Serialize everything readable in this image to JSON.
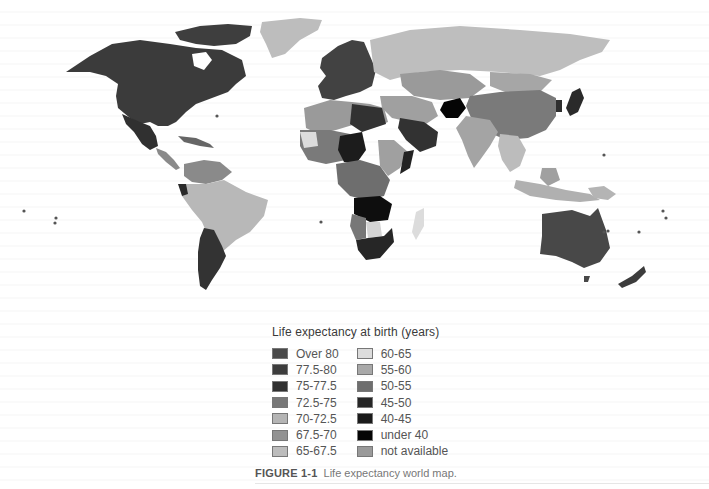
{
  "figure": {
    "number_label": "FIGURE 1-1",
    "caption": "Life expectancy world map."
  },
  "legend": {
    "title": "Life expectancy at birth (years)",
    "left_column": [
      {
        "label": "Over 80",
        "color": "#4a4a4a"
      },
      {
        "label": "77.5-80",
        "color": "#3c3c3c"
      },
      {
        "label": "75-77.5",
        "color": "#303030"
      },
      {
        "label": "72.5-75",
        "color": "#777777"
      },
      {
        "label": "70-72.5",
        "color": "#b4b4b4"
      },
      {
        "label": "67.5-70",
        "color": "#929292"
      },
      {
        "label": "65-67.5",
        "color": "#bcbcbc"
      }
    ],
    "right_column": [
      {
        "label": "60-65",
        "color": "#dcdcdc"
      },
      {
        "label": "55-60",
        "color": "#a8a8a8"
      },
      {
        "label": "50-55",
        "color": "#6e6e6e"
      },
      {
        "label": "45-50",
        "color": "#262626"
      },
      {
        "label": "40-45",
        "color": "#1a1a1a"
      },
      {
        "label": "under 40",
        "color": "#050505"
      },
      {
        "label": "not available",
        "color": "#9a9a9a"
      }
    ]
  },
  "map": {
    "type": "choropleth",
    "subject": "Life expectancy at birth by country",
    "regions": [
      {
        "name": "North America (Canada/USA)",
        "band": "77.5-80",
        "color": "#3c3c3c"
      },
      {
        "name": "Mexico",
        "band": "75-77.5",
        "color": "#303030"
      },
      {
        "name": "Greenland",
        "band": "67.5-70",
        "color": "#b8b8b8"
      },
      {
        "name": "Brazil / Amazon South America",
        "band": "70-72.5",
        "color": "#b4b4b4"
      },
      {
        "name": "Argentina / Chile",
        "band": "75-77.5",
        "color": "#333333"
      },
      {
        "name": "Europe",
        "band": "77.5-80",
        "color": "#404040"
      },
      {
        "name": "Russia",
        "band": "65-67.5",
        "color": "#bcbcbc"
      },
      {
        "name": "China",
        "band": "72.5-75",
        "color": "#7a7a7a"
      },
      {
        "name": "India",
        "band": "60-65",
        "color": "#a8a8a8"
      },
      {
        "name": "Afghanistan",
        "band": "under 40",
        "color": "#050505"
      },
      {
        "name": "Saudi Arabia",
        "band": "72.5-75",
        "color": "#333333"
      },
      {
        "name": "Sahel / West Africa",
        "band": "50-55",
        "color": "#7a7a7a"
      },
      {
        "name": "Central/Southern Africa",
        "band": "40-45",
        "color": "#1a1a1a"
      },
      {
        "name": "South Africa",
        "band": "45-50",
        "color": "#262626"
      },
      {
        "name": "Madagascar",
        "band": "60-65",
        "color": "#dcdcdc"
      },
      {
        "name": "Southeast Asia",
        "band": "65-67.5",
        "color": "#bcbcbc"
      },
      {
        "name": "Japan",
        "band": "Over 80",
        "color": "#2a2a2a"
      },
      {
        "name": "Australia",
        "band": "Over 80",
        "color": "#484848"
      },
      {
        "name": "New Zealand",
        "band": "77.5-80",
        "color": "#3c3c3c"
      }
    ]
  }
}
